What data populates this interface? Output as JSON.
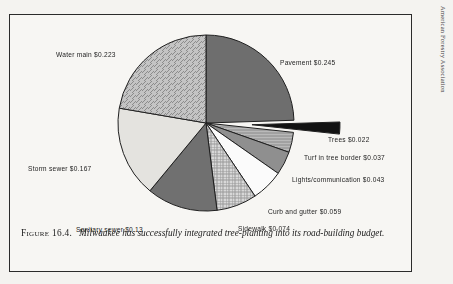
{
  "page": {
    "running_head": "American Forestry Association"
  },
  "caption": {
    "figure_number": "Figure 16.4.",
    "text": "Milwaukee has successfully integrated tree-planting into its road-building budget."
  },
  "chart_data": {
    "type": "pie",
    "unit": "dollars per square foot",
    "start_angle_deg": -90,
    "direction": "clockwise",
    "total": 1.0,
    "categories": [
      "Pavement",
      "Trees",
      "Turf in tree border",
      "Lights/communication",
      "Curb and gutter",
      "Sidewalk",
      "Sanitary sewer",
      "Storm sewer",
      "Water main"
    ],
    "values": [
      0.245,
      0.022,
      0.037,
      0.043,
      0.059,
      0.074,
      0.13,
      0.167,
      0.223
    ],
    "slices": [
      {
        "label": "Pavement $0.245",
        "name": "Pavement",
        "value": 0.245,
        "fill": "dark-gray",
        "color": "#6e6e6e",
        "exploded": false,
        "label_x": 270,
        "label_y": 44
      },
      {
        "label": "Trees $0.022",
        "name": "Trees",
        "value": 0.022,
        "fill": "black",
        "color": "#121212",
        "exploded": true,
        "label_x": 318,
        "label_y": 121
      },
      {
        "label": "Turf in tree border $0.037",
        "name": "Turf in tree border",
        "value": 0.037,
        "fill": "horizontal-hatch",
        "color": "#b9b9b9",
        "exploded": false,
        "label_x": 294,
        "label_y": 139
      },
      {
        "label": "Lights/communication $0.043",
        "name": "Lights/communication",
        "value": 0.043,
        "fill": "medium-gray",
        "color": "#8f8f8f",
        "exploded": false,
        "label_x": 282,
        "label_y": 161
      },
      {
        "label": "Curb and gutter $0.059",
        "name": "Curb and gutter",
        "value": 0.059,
        "fill": "white",
        "color": "#fbfbfb",
        "exploded": false,
        "label_x": 258,
        "label_y": 193
      },
      {
        "label": "Sidewalk $0.074",
        "name": "Sidewalk",
        "value": 0.074,
        "fill": "cross-hatch",
        "color": "#d8d8d8",
        "exploded": false,
        "label_x": 228,
        "label_y": 210
      },
      {
        "label": "Sanitary sewer $0.13",
        "name": "Sanitary sewer",
        "value": 0.13,
        "fill": "dark-gray",
        "color": "#707070",
        "exploded": false,
        "label_x": 66,
        "label_y": 211
      },
      {
        "label": "Storm sewer $0.167",
        "name": "Storm sewer",
        "value": 0.167,
        "fill": "light-gray",
        "color": "#e4e3df",
        "exploded": false,
        "label_x": 18,
        "label_y": 150
      },
      {
        "label": "Water main $0.223",
        "name": "Water main",
        "value": 0.223,
        "fill": "diagonal-hatch",
        "color": "#c4c4c4",
        "exploded": false,
        "label_x": 46,
        "label_y": 36
      }
    ],
    "geometry": {
      "center_x": 196,
      "center_y": 108,
      "radius": 88,
      "explode_offset": 46
    },
    "legend": "inline-labels",
    "grid": false
  }
}
